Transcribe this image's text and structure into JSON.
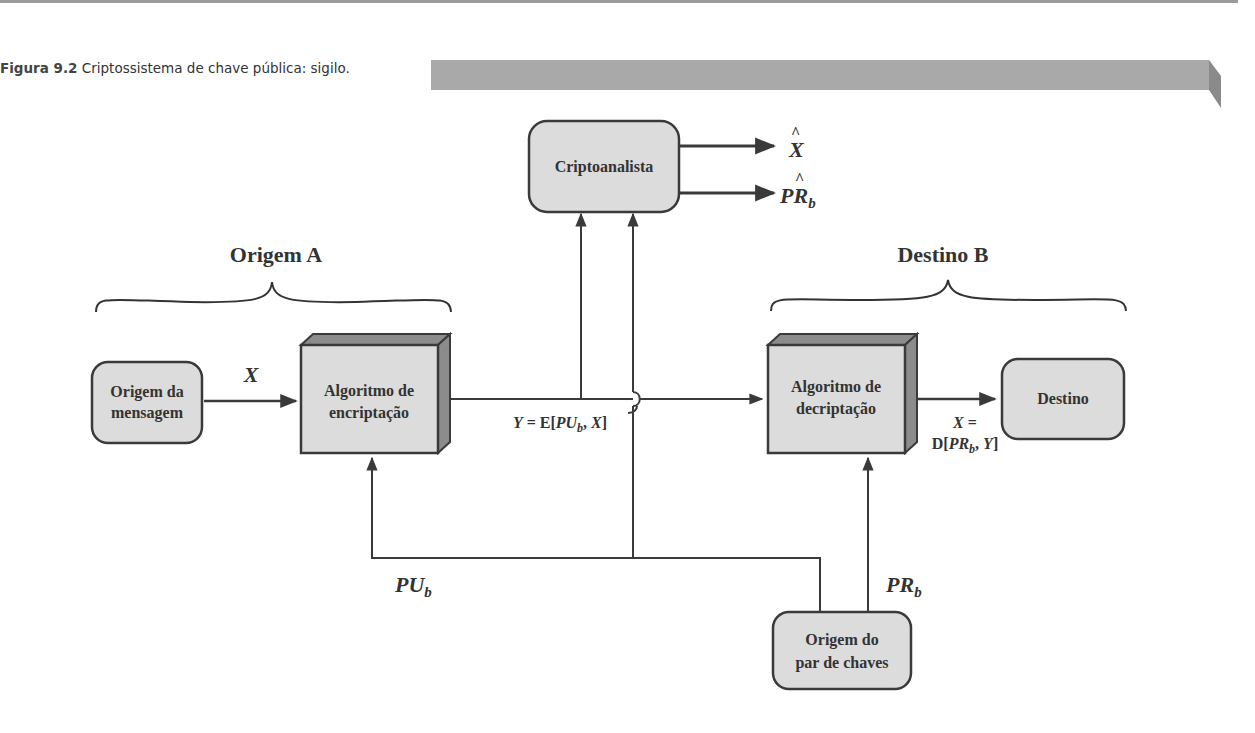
{
  "caption": {
    "figure_number": "Figura 9.2",
    "title": "Criptossistema de chave pública: sigilo."
  },
  "groups": {
    "source": "Origem A",
    "destination": "Destino B"
  },
  "nodes": {
    "message_source": [
      "Origem da",
      "mensagem"
    ],
    "encryption": [
      "Algoritmo de",
      "encriptação"
    ],
    "decryption": [
      "Algoritmo de",
      "decriptação"
    ],
    "destination": "Destino",
    "cryptanalyst": "Criptoanalista",
    "key_pair_source": [
      "Origem do",
      "par de chaves"
    ]
  },
  "edge_labels": {
    "plaintext": "X",
    "ciphertext": "Y = E[PU_b, X]",
    "decrypted": [
      "X =",
      "D[PR_b, Y]"
    ],
    "public_key": "PU_b",
    "private_key": "PR_b",
    "estimate_x": "X̂",
    "estimate_prb": "PR̂_b"
  },
  "colors": {
    "box_fill": "#dcdcdc",
    "box_stroke": "#3a3a3a",
    "box_side": "#8c8c8c",
    "text": "#333333",
    "caption_bar": "#a9a9a9"
  }
}
